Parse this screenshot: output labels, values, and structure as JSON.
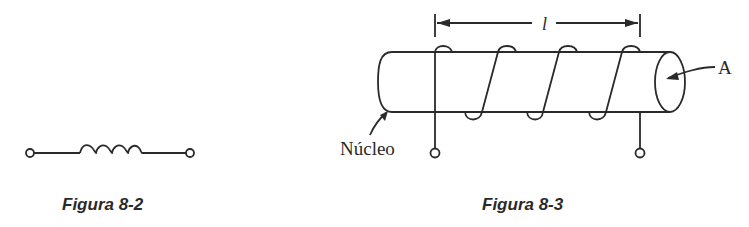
{
  "figures": [
    {
      "id": "fig-8-2",
      "caption": "Figura 8-2",
      "description": "Inductor schematic symbol with two terminals"
    },
    {
      "id": "fig-8-3",
      "caption": "Figura 8-3",
      "description": "Coil wound around cylindrical core",
      "labels": {
        "length": "l",
        "area": "A",
        "core": "Núcleo"
      }
    }
  ]
}
